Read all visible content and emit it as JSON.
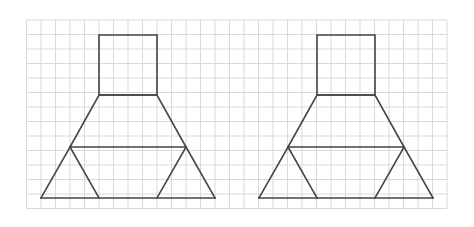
{
  "diagram": {
    "background": "#ffffff",
    "grid": {
      "x0": 26.5,
      "y0": 20,
      "cell": 14.5,
      "cols": 29,
      "rows": 13,
      "color": "#d9d9d9"
    },
    "stroke_color": "#444444",
    "figures": [
      {
        "name": "figure-left",
        "offset_x": 0,
        "square": [
          [
            99,
            35
          ],
          [
            157,
            35
          ],
          [
            157,
            95
          ],
          [
            99,
            95
          ]
        ],
        "trapezoid": [
          [
            99,
            95
          ],
          [
            157,
            95
          ],
          [
            186,
            147
          ],
          [
            70,
            147
          ]
        ],
        "outer_triangle_base": [
          [
            41,
            198
          ],
          [
            215,
            198
          ]
        ],
        "left_side": [
          [
            70,
            147
          ],
          [
            41,
            198
          ]
        ],
        "right_side": [
          [
            186,
            147
          ],
          [
            215,
            198
          ]
        ],
        "inner_left": [
          [
            70,
            147
          ],
          [
            99,
            198
          ]
        ],
        "inner_right": [
          [
            186,
            147
          ],
          [
            157,
            198
          ]
        ]
      },
      {
        "name": "figure-right",
        "offset_x": 218,
        "square": [
          [
            99,
            35
          ],
          [
            157,
            35
          ],
          [
            157,
            95
          ],
          [
            99,
            95
          ]
        ],
        "trapezoid": [
          [
            99,
            95
          ],
          [
            157,
            95
          ],
          [
            186,
            147
          ],
          [
            70,
            147
          ]
        ],
        "outer_triangle_base": [
          [
            41,
            198
          ],
          [
            215,
            198
          ]
        ],
        "left_side": [
          [
            70,
            147
          ],
          [
            41,
            198
          ]
        ],
        "right_side": [
          [
            186,
            147
          ],
          [
            215,
            198
          ]
        ],
        "inner_left": [
          [
            70,
            147
          ],
          [
            99,
            198
          ]
        ],
        "inner_right": [
          [
            186,
            147
          ],
          [
            157,
            198
          ]
        ]
      }
    ]
  }
}
